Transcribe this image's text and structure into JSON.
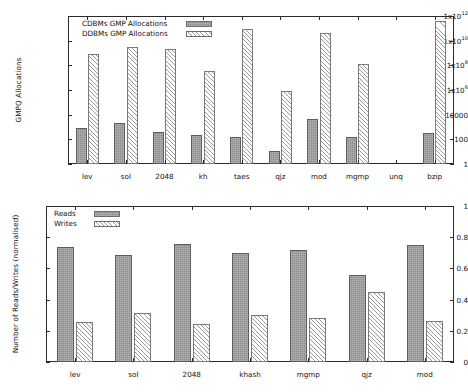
{
  "chart_data": [
    {
      "type": "bar",
      "id": "gmp-allocations",
      "title": "",
      "xlabel": "",
      "ylabel": "GMPQ Allocations",
      "yscale": "log",
      "ylim": [
        1,
        1000000000000
      ],
      "ytick_labels": [
        "1",
        "100",
        "10000",
        "1x10",
        "1x10",
        "1x10",
        "1x10"
      ],
      "yticks": [
        {
          "label": "1",
          "exp": "",
          "value": 1
        },
        {
          "label": "100",
          "exp": "",
          "value": 100
        },
        {
          "label": "10000",
          "exp": "",
          "value": 10000
        },
        {
          "label": "1x10",
          "exp": "6",
          "value": 1000000
        },
        {
          "label": "1x10",
          "exp": "8",
          "value": 100000000
        },
        {
          "label": "1x10",
          "exp": "10",
          "value": 10000000000
        },
        {
          "label": "1x10",
          "exp": "12",
          "value": 1000000000000
        }
      ],
      "grid": false,
      "legend_position": "top-left",
      "categories": [
        "lev",
        "sol",
        "2048",
        "kh",
        "taes",
        "qjz",
        "mod",
        "mgmp",
        "unq",
        "bzip"
      ],
      "series": [
        {
          "name": "CDBMs GMP Allocations",
          "fill": "solid",
          "values": [
            900,
            2300,
            420,
            210,
            160,
            12,
            4100,
            150,
            0,
            340
          ]
        },
        {
          "name": "DDBMs GMP Allocations",
          "fill": "hatch",
          "values": [
            840000000,
            3100000000,
            2200000000,
            36000000,
            92000000000,
            810000,
            45000000000,
            130000000,
            0,
            370000000000
          ]
        }
      ]
    },
    {
      "type": "bar",
      "id": "reads-writes",
      "title": "",
      "xlabel": "",
      "ylabel": "Number of Reads/Writes (normalised)",
      "yscale": "linear",
      "ylim": [
        0,
        1
      ],
      "yticks": [
        {
          "label": "0",
          "exp": "",
          "value": 0
        },
        {
          "label": "0.2",
          "exp": "",
          "value": 0.2
        },
        {
          "label": "0.4",
          "exp": "",
          "value": 0.4
        },
        {
          "label": "0.6",
          "exp": "",
          "value": 0.6
        },
        {
          "label": "0.8",
          "exp": "",
          "value": 0.8
        },
        {
          "label": "1",
          "exp": "",
          "value": 1
        }
      ],
      "grid": false,
      "legend_position": "top-left",
      "categories": [
        "lev",
        "sol",
        "2048",
        "khash",
        "mgmp",
        "qjz",
        "mod"
      ],
      "series": [
        {
          "name": "Reads",
          "fill": "solid",
          "values": [
            0.74,
            0.685,
            0.755,
            0.7,
            0.72,
            0.56,
            0.75
          ]
        },
        {
          "name": "Writes",
          "fill": "hatch",
          "values": [
            0.255,
            0.315,
            0.245,
            0.3,
            0.28,
            0.45,
            0.26
          ]
        }
      ]
    }
  ]
}
